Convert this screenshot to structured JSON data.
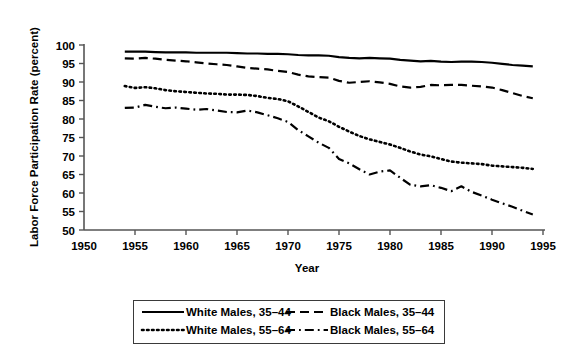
{
  "chart_data": {
    "type": "line",
    "title": "",
    "xlabel": "Year",
    "ylabel": "Labor Force Participation Rate (percent)",
    "xlim": [
      1950,
      1995
    ],
    "ylim": [
      50,
      100
    ],
    "xticks": [
      1950,
      1955,
      1960,
      1965,
      1970,
      1975,
      1980,
      1985,
      1990,
      1995
    ],
    "yticks": [
      50,
      55,
      60,
      65,
      70,
      75,
      80,
      85,
      90,
      95,
      100
    ],
    "grid": false,
    "legend_position": "below",
    "x": [
      1954,
      1955,
      1956,
      1957,
      1958,
      1959,
      1960,
      1961,
      1962,
      1963,
      1964,
      1965,
      1966,
      1967,
      1968,
      1969,
      1970,
      1971,
      1972,
      1973,
      1974,
      1975,
      1976,
      1977,
      1978,
      1979,
      1980,
      1981,
      1982,
      1983,
      1984,
      1985,
      1986,
      1987,
      1988,
      1989,
      1990,
      1991,
      1992,
      1993,
      1994
    ],
    "series": [
      {
        "name": "White Males, 35-44",
        "style": "solid",
        "values": [
          98.2,
          98.2,
          98.2,
          98.1,
          98.0,
          98.0,
          98.0,
          97.9,
          97.9,
          97.9,
          97.9,
          97.8,
          97.7,
          97.7,
          97.6,
          97.6,
          97.5,
          97.3,
          97.2,
          97.2,
          97.1,
          96.7,
          96.5,
          96.4,
          96.5,
          96.4,
          96.3,
          96.0,
          95.8,
          95.6,
          95.7,
          95.5,
          95.4,
          95.5,
          95.5,
          95.4,
          95.2,
          94.9,
          94.6,
          94.4,
          94.2
        ]
      },
      {
        "name": "Black Males, 35-44",
        "style": "dashed",
        "values": [
          96.4,
          96.3,
          96.5,
          96.3,
          96.0,
          95.8,
          95.6,
          95.3,
          95.0,
          94.8,
          94.6,
          94.2,
          93.8,
          93.6,
          93.4,
          93.0,
          92.7,
          92.0,
          91.5,
          91.3,
          91.2,
          90.3,
          89.8,
          90.0,
          90.2,
          89.9,
          89.5,
          88.8,
          88.5,
          88.7,
          89.2,
          89.1,
          89.2,
          89.2,
          89.0,
          88.8,
          88.5,
          87.8,
          87.0,
          86.2,
          85.6
        ]
      },
      {
        "name": "White Males, 55-64",
        "style": "dotted",
        "values": [
          88.9,
          88.4,
          88.6,
          88.3,
          87.8,
          87.5,
          87.3,
          87.1,
          86.9,
          86.8,
          86.6,
          86.6,
          86.5,
          86.2,
          85.7,
          85.4,
          84.8,
          83.4,
          81.9,
          80.4,
          79.4,
          77.9,
          76.6,
          75.4,
          74.5,
          73.8,
          73.1,
          72.2,
          71.2,
          70.4,
          69.9,
          69.2,
          68.5,
          68.2,
          68.0,
          67.8,
          67.4,
          67.2,
          67.0,
          66.8,
          66.5
        ]
      },
      {
        "name": "Black Males, 55-64",
        "style": "dashdot",
        "values": [
          83.0,
          83.1,
          83.8,
          83.3,
          82.9,
          83.1,
          82.8,
          82.5,
          82.7,
          82.3,
          81.9,
          81.8,
          82.3,
          81.8,
          81.0,
          80.2,
          79.2,
          77.0,
          75.3,
          73.6,
          72.2,
          69.2,
          68.0,
          66.4,
          65.0,
          65.8,
          66.1,
          64.1,
          62.2,
          61.8,
          62.1,
          61.4,
          60.5,
          61.8,
          60.3,
          59.3,
          58.2,
          57.2,
          56.3,
          55.2,
          54.2
        ]
      }
    ],
    "legend": [
      {
        "label": "White Males, 35–44",
        "style": "solid"
      },
      {
        "label": "Black Males, 35–44",
        "style": "dashed"
      },
      {
        "label": "White Males, 55–64",
        "style": "dotted"
      },
      {
        "label": "Black Males, 55–64",
        "style": "dashdot"
      }
    ],
    "colors": {
      "line": "#000000",
      "axis": "#555555",
      "background": "#ffffff"
    }
  }
}
